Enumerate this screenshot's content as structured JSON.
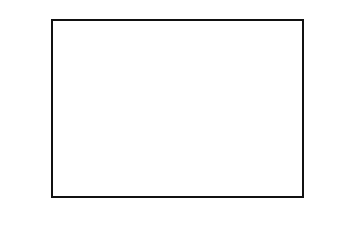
{
  "chart_data": {
    "type": "bar",
    "title": "",
    "xlabel": "",
    "ylabel": "Percent Responses",
    "categories": [
      "A",
      "B",
      "C",
      "D"
    ],
    "values": [
      19.0,
      77.5,
      0.5,
      2.5
    ],
    "bar_colors": [
      "#7a7a7a",
      "#0a0a0a",
      "#333333",
      "#7a7a7a"
    ],
    "ylim": [
      0,
      90
    ],
    "yticks": [
      "0.0",
      "10.0",
      "20.0",
      "30.0",
      "40.0",
      "50.0",
      "60.0",
      "70.0",
      "80.0",
      "90.0"
    ],
    "grid": true,
    "legend": null
  }
}
